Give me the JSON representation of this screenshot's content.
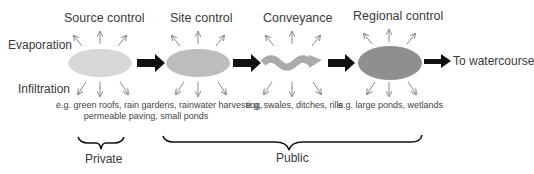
{
  "diagram": {
    "side_labels": {
      "top": "Evaporation",
      "bottom": "Infiltration"
    },
    "stages": [
      {
        "title": "Source control",
        "shape": "ellipse",
        "color": "#d6d6d6",
        "examples": "e.g. green roofs, rain gardens, rainwater harvesting,",
        "examples2": "permeable paving, small ponds"
      },
      {
        "title": "Site control",
        "shape": "ellipse",
        "color": "#bcbcbc",
        "examples": ""
      },
      {
        "title": "Conveyance",
        "shape": "wave-arrow",
        "color": "#a9a9a9",
        "examples": "e.g. swales, ditches, rills"
      },
      {
        "title": "Regional control",
        "shape": "ellipse",
        "color": "#8f8f8f",
        "examples": "e.g. large ponds, wetlands"
      }
    ],
    "outlet": "To watercourse",
    "groups": [
      {
        "label": "Private"
      },
      {
        "label": "Public"
      }
    ],
    "colors": {
      "flow_arrow": "#111111",
      "thin_arrow": "#8a8a8a"
    }
  }
}
